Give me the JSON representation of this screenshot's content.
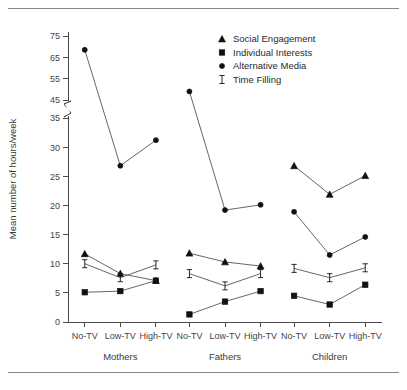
{
  "chart_data": {
    "type": "line",
    "title": "",
    "xlabel": "",
    "ylabel": "Mean number of hours/week",
    "grid": false,
    "legend_position": "top-right",
    "y_ticks": [
      0,
      5,
      10,
      15,
      20,
      25,
      30,
      35,
      45,
      55,
      65,
      75
    ],
    "y_tick_labels": [
      "0",
      "5",
      "10",
      "15",
      "20",
      "25",
      "30",
      "35",
      "45",
      "55",
      "65",
      "75"
    ],
    "y_axis_break": {
      "between": [
        35,
        45
      ],
      "marker": "zigzag"
    },
    "ylim": [
      0,
      75
    ],
    "x_categories": [
      "No-TV",
      "Low-TV",
      "High-TV"
    ],
    "groups": [
      "Mothers",
      "Fathers",
      "Children"
    ],
    "series": [
      {
        "name": "Social Engagement",
        "marker": "triangle",
        "values": {
          "Mothers": [
            11.7,
            8.3,
            7.1
          ],
          "Fathers": [
            11.8,
            10.3,
            9.6
          ],
          "Children": [
            26.8,
            21.9,
            25.1
          ]
        }
      },
      {
        "name": "Individual Interests",
        "marker": "square",
        "values": {
          "Mothers": [
            5.1,
            5.3,
            7.1
          ],
          "Fathers": [
            1.3,
            3.5,
            5.3
          ],
          "Children": [
            4.5,
            3.0,
            6.4
          ]
        }
      },
      {
        "name": "Alternative Media",
        "marker": "circle",
        "values": {
          "Mothers": [
            68.5,
            26.8,
            31.2
          ],
          "Fathers": [
            49.0,
            19.2,
            20.1
          ],
          "Children": [
            18.9,
            11.5,
            14.6
          ]
        }
      },
      {
        "name": "Time Filling",
        "marker": "bar",
        "values": {
          "Mothers": [
            10.0,
            7.6,
            9.8
          ],
          "Fathers": [
            8.3,
            6.2,
            8.3
          ],
          "Children": [
            9.2,
            7.6,
            9.3
          ]
        }
      }
    ]
  },
  "legend": {
    "entries": [
      {
        "label": "Social Engagement",
        "marker": "triangle"
      },
      {
        "label": "Individual Interests",
        "marker": "square"
      },
      {
        "label": "Alternative Media",
        "marker": "circle"
      },
      {
        "label": "Time Filling",
        "marker": "bar"
      }
    ]
  },
  "colors": {
    "line": "#555555",
    "marker": "#111111",
    "axis": "#4a4a4a",
    "text": "#2a2a2a",
    "rule": "#8a8a8a",
    "background": "#ffffff"
  }
}
